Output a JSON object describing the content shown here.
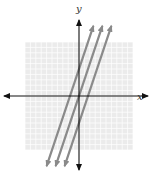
{
  "chart_data": {
    "type": "line",
    "title": "",
    "xlabel": "x",
    "ylabel": "y",
    "xlim": [
      -10,
      10
    ],
    "ylim": [
      -10,
      10
    ],
    "grid": true,
    "legend": null,
    "tick_labels": false,
    "series": [
      {
        "name": "line-1",
        "slope": 3,
        "y_intercept": 5,
        "x_intercept": -1.67
      },
      {
        "name": "line-2",
        "slope": 3,
        "y_intercept": 0,
        "x_intercept": 0
      },
      {
        "name": "line-3",
        "slope": 3,
        "y_intercept": -5,
        "x_intercept": 1.67
      }
    ],
    "annotations": [
      "three parallel lines with arrows at both ends"
    ]
  },
  "axes": {
    "x_label": "x",
    "y_label": "y"
  },
  "colors": {
    "grid_bg": "#ebebeb",
    "grid_line": "#ffffff",
    "axis": "#111111",
    "series_line": "#8a8a8a"
  }
}
